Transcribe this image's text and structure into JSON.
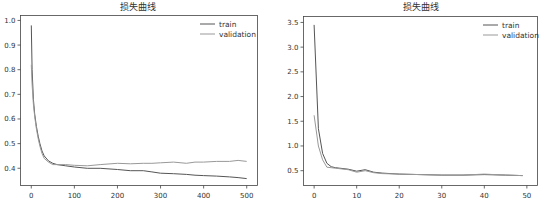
{
  "chart_data": [
    {
      "type": "line",
      "title": "损失曲线",
      "xlabel": "",
      "ylabel": "",
      "xlim": [
        -25,
        525
      ],
      "ylim": [
        0.33,
        1.02
      ],
      "xticks": [
        0,
        100,
        200,
        300,
        400,
        500
      ],
      "yticks": [
        0.4,
        0.5,
        0.6,
        0.7,
        0.8,
        0.9,
        1.0
      ],
      "ytick_labels": [
        "0.4",
        "0.5",
        "0.6",
        "0.7",
        "0.8",
        "0.9",
        "1.0"
      ],
      "grid": false,
      "legend_position": "upper right",
      "series": [
        {
          "name": "train",
          "color": "#555555",
          "x": [
            0,
            2,
            5,
            8,
            12,
            16,
            20,
            25,
            30,
            40,
            50,
            60,
            80,
            100,
            130,
            160,
            200,
            230,
            260,
            280,
            300,
            330,
            360,
            380,
            400,
            430,
            460,
            480,
            500
          ],
          "y": [
            0.98,
            0.8,
            0.68,
            0.62,
            0.57,
            0.53,
            0.5,
            0.47,
            0.45,
            0.43,
            0.42,
            0.415,
            0.41,
            0.405,
            0.4,
            0.4,
            0.395,
            0.39,
            0.39,
            0.385,
            0.38,
            0.378,
            0.375,
            0.372,
            0.37,
            0.368,
            0.365,
            0.362,
            0.358
          ]
        },
        {
          "name": "validation",
          "color": "#999999",
          "x": [
            0,
            2,
            5,
            8,
            12,
            16,
            20,
            25,
            30,
            40,
            50,
            60,
            80,
            100,
            130,
            160,
            200,
            230,
            260,
            280,
            300,
            330,
            360,
            380,
            400,
            430,
            460,
            480,
            500
          ],
          "y": [
            0.82,
            0.74,
            0.66,
            0.61,
            0.56,
            0.52,
            0.49,
            0.46,
            0.44,
            0.425,
            0.415,
            0.415,
            0.415,
            0.412,
            0.41,
            0.415,
            0.42,
            0.418,
            0.42,
            0.42,
            0.422,
            0.425,
            0.42,
            0.425,
            0.425,
            0.428,
            0.428,
            0.432,
            0.428
          ]
        }
      ]
    },
    {
      "type": "line",
      "title": "损失曲线",
      "xlabel": "",
      "ylabel": "",
      "xlim": [
        -2.5,
        52.5
      ],
      "ylim": [
        0.2,
        3.62
      ],
      "xticks": [
        0,
        10,
        20,
        30,
        40,
        50
      ],
      "yticks": [
        0.5,
        1.0,
        1.5,
        2.0,
        2.5,
        3.0,
        3.5
      ],
      "ytick_labels": [
        "0.5",
        "1.0",
        "1.5",
        "2.0",
        "2.5",
        "3.0",
        "3.5"
      ],
      "grid": false,
      "legend_position": "upper right",
      "series": [
        {
          "name": "train",
          "color": "#555555",
          "x": [
            0,
            1,
            2,
            3,
            4,
            5,
            6,
            8,
            10,
            12,
            14,
            16,
            20,
            25,
            30,
            35,
            40,
            45,
            49
          ],
          "y": [
            3.45,
            1.35,
            0.85,
            0.65,
            0.58,
            0.56,
            0.55,
            0.53,
            0.49,
            0.52,
            0.47,
            0.45,
            0.43,
            0.42,
            0.41,
            0.41,
            0.42,
            0.41,
            0.4
          ]
        },
        {
          "name": "validation",
          "color": "#999999",
          "x": [
            0,
            1,
            2,
            3,
            4,
            5,
            6,
            8,
            10,
            12,
            14,
            16,
            20,
            25,
            30,
            35,
            40,
            45,
            49
          ],
          "y": [
            1.62,
            1.0,
            0.72,
            0.57,
            0.56,
            0.55,
            0.54,
            0.52,
            0.47,
            0.5,
            0.46,
            0.44,
            0.43,
            0.42,
            0.41,
            0.41,
            0.43,
            0.41,
            0.4
          ]
        }
      ]
    }
  ],
  "charts": [
    {
      "title": "损失曲线",
      "legend": [
        "train",
        "validation"
      ],
      "xtick_labels": [
        "0",
        "100",
        "200",
        "300",
        "400",
        "500"
      ],
      "ytick_labels": [
        "0.4",
        "0.5",
        "0.6",
        "0.7",
        "0.8",
        "0.9",
        "1.0"
      ]
    },
    {
      "title": "损失曲线",
      "legend": [
        "train",
        "validation"
      ],
      "xtick_labels": [
        "0",
        "10",
        "20",
        "30",
        "40",
        "50"
      ],
      "ytick_labels": [
        "0.5",
        "1.0",
        "1.5",
        "2.0",
        "2.5",
        "3.0",
        "3.5"
      ]
    }
  ]
}
